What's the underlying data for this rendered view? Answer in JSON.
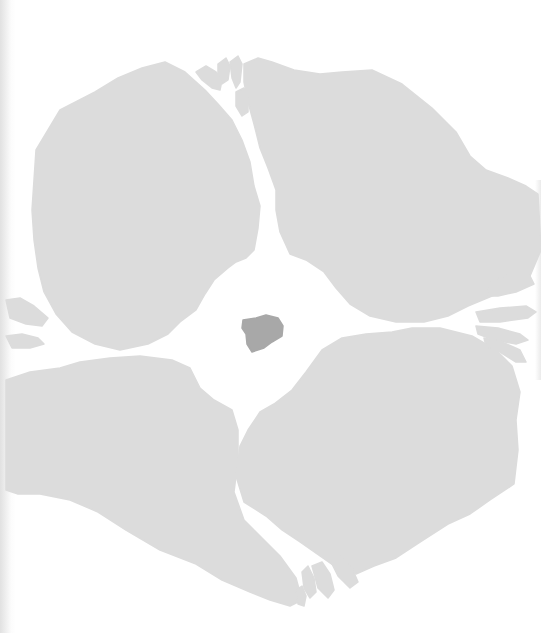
{
  "illustration": {
    "width": 541,
    "height": 633,
    "background": "#ffffff",
    "colors": {
      "landmass": "#dcdcdc",
      "core": "#a8a8a8"
    },
    "landmasses": [
      {
        "name": "upper-left-landmass",
        "path": "M36,150 L60,110 L95,92 L118,78 L142,68 L165,62 L185,72 L205,90 L218,104 L232,120 L242,140 L250,162 L254,186 L260,206 L258,228 L254,250 L246,258 L236,262 L228,268 L214,280 L205,294 L196,310 L180,322 L168,334 L148,344 L120,350 L95,344 L72,332 L56,314 L44,292 L38,268 L34,240 L32,210 L34,180 Z"
      },
      {
        "name": "upper-right-landmass",
        "path": "M244,64 L258,58 L272,62 L294,70 L320,74 L342,72 L372,70 L402,84 L432,108 L456,132 L470,156 L486,170 L508,178 L526,186 L538,194 L541,250 L530,276 L512,288 L492,296 L468,306 L448,316 L424,322 L396,322 L370,316 L350,304 L336,288 L324,272 L306,260 L290,254 L280,232 L276,210 L276,190 L268,168 L260,148 L254,124 L248,102 L244,82 Z"
      },
      {
        "name": "lower-left-landmass",
        "path": "M6,380 L30,372 L60,368 L80,362 L110,358 L140,356 L172,360 L190,368 L200,388 L214,400 L232,410 L238,430 L238,460 L234,492 L244,520 L262,538 L280,556 L296,578 L302,600 L290,606 L270,600 L250,592 L222,580 L196,564 L160,550 L126,530 L98,512 L70,500 L40,494 L18,494 L6,490 Z"
      },
      {
        "name": "lower-right-landmass",
        "path": "M342,338 L366,334 L392,332 L412,328 L440,328 L472,336 L496,350 L512,366 L520,392 L516,420 L518,450 L514,484 L490,500 L470,514 L448,524 L420,542 L396,558 L374,566 L356,574 L340,570 L320,556 L300,542 L282,530 L266,516 L244,502 L236,476 L240,446 L248,430 L260,412 L274,404 L292,390 L306,372 L322,350 Z"
      }
    ],
    "islets": [
      {
        "name": "top-delta-islet-1",
        "path": "M196,72 L206,66 L216,72 L222,80 L220,90 L212,88 L202,80 Z"
      },
      {
        "name": "top-delta-islet-2",
        "path": "M218,64 L226,58 L230,66 L228,80 L222,84 L218,76 Z"
      },
      {
        "name": "top-delta-islet-3",
        "path": "M230,62 L238,56 L242,64 L240,82 L236,88 L232,78 Z"
      },
      {
        "name": "top-delta-islet-4",
        "path": "M236,92 L244,88 L248,98 L248,112 L242,116 L236,106 Z"
      },
      {
        "name": "right-delta-islet-1",
        "path": "M492,280 L512,274 L530,276 L534,284 L516,292 L498,296 L486,296 Z"
      },
      {
        "name": "right-delta-islet-2",
        "path": "M476,312 L500,308 L526,306 L536,312 L528,318 L500,322 L480,322 Z"
      },
      {
        "name": "right-delta-islet-3",
        "path": "M476,326 L498,328 L520,334 L528,340 L516,344 L494,340 L478,334 Z"
      },
      {
        "name": "right-delta-islet-4",
        "path": "M484,338 L502,342 L520,350 L526,362 L516,362 L500,352 L486,346 Z"
      },
      {
        "name": "left-delta-islet-1",
        "path": "M6,300 L20,298 L34,306 L48,318 L42,326 L26,324 L10,318 Z"
      },
      {
        "name": "left-delta-islet-2",
        "path": "M6,336 L22,334 L38,338 L44,344 L30,348 L12,348 Z"
      },
      {
        "name": "bottom-delta-islet-1",
        "path": "M312,566 L322,562 L330,574 L334,590 L328,598 L318,588 Z"
      },
      {
        "name": "bottom-delta-islet-2",
        "path": "M302,572 L308,566 L314,578 L316,592 L310,598 L304,588 Z"
      },
      {
        "name": "bottom-delta-islet-3",
        "path": "M330,560 L342,556 L352,568 L358,582 L350,588 L338,576 Z"
      },
      {
        "name": "bottom-delta-islet-4",
        "path": "M296,590 L302,586 L306,596 L304,606 L298,604 Z"
      }
    ],
    "core": {
      "name": "central-core-blob",
      "path": "M243,320 L256,318 L266,315 L278,318 L283,326 L282,336 L272,342 L264,348 L252,352 L247,344 L246,334 L242,328 Z"
    }
  }
}
